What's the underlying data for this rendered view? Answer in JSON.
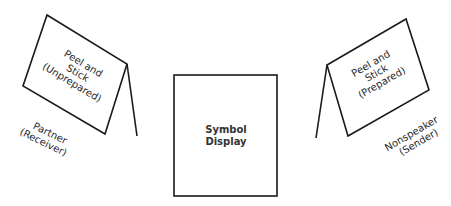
{
  "diagram": {
    "left_card": {
      "lines": [
        "Peel and",
        "Stick",
        "(Unprepared)"
      ]
    },
    "left_person": {
      "lines": [
        "Partner",
        "(Receiver)"
      ]
    },
    "center_display": {
      "lines": [
        "Symbol",
        "Display"
      ]
    },
    "right_card": {
      "lines": [
        "Peel and",
        "Stick",
        "(Prepared)"
      ]
    },
    "right_person": {
      "lines": [
        "Nonspeaker",
        "(Sender)"
      ]
    },
    "colors": {
      "line": "#1a1a1a",
      "background": "#ffffff"
    }
  }
}
